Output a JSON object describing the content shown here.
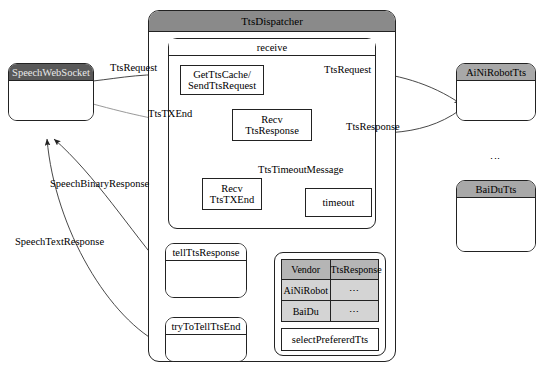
{
  "diagram": {
    "colors": {
      "header_dark": "#595959",
      "header_gray": "#a8a8a8",
      "container_header": "#8a8a8a",
      "table_head": "#b5b5b5",
      "table_cell": "#d4d4d4",
      "stroke": "#222222",
      "background": "#ffffff"
    }
  },
  "left": {
    "websocket": {
      "title": "SpeechWebSocket"
    }
  },
  "dispatcher": {
    "title": "TtsDispatcher",
    "receive": {
      "title": "receive",
      "nodes": [
        {
          "id": "get-tts-cache",
          "line1": "GetTtsCache/",
          "line2": "SendTtsRequest"
        },
        {
          "id": "recv-tts-response",
          "line1": "Recv",
          "line2": "TtsResponse"
        },
        {
          "id": "recv-tts-txend",
          "line1": "Recv",
          "line2": "TtsTXEnd"
        },
        {
          "id": "timeout",
          "line1": "timeout",
          "line2": ""
        }
      ],
      "self_loop_label": "TtsTimeoutMessage"
    },
    "nodes": [
      {
        "id": "tell-tts-response",
        "title": "tellTtsResponse"
      },
      {
        "id": "try-to-tell-tts-end",
        "title": "tryToTellTtsEnd"
      }
    ],
    "table": {
      "headers": [
        "Vendor",
        "TtsResponse"
      ],
      "rows": [
        [
          "AiNiRobot",
          "⋯"
        ],
        [
          "BaiDu",
          "⋯"
        ]
      ],
      "action_label": "selectPrefererdTts"
    }
  },
  "vendors": {
    "items": [
      {
        "id": "ainirobot-tts",
        "title": "AiNiRobotTts"
      },
      {
        "id": "baidu-tts",
        "title": "BaiDuTts"
      }
    ],
    "ellipsis": "⋮"
  },
  "edge_labels": {
    "tts_request_left": "TtsRequest",
    "tts_request_right": "TtsRequest",
    "tts_txend": "TtsTXEnd",
    "tts_response": "TtsResponse",
    "speech_binary_response": "SpeechBinaryResponse",
    "speech_text_response": "SpeechTextResponse"
  }
}
